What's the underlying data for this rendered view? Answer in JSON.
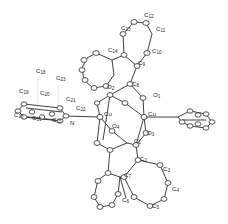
{
  "diagram": {
    "type": "ORTEP molecular structure",
    "metal_centers": [
      {
        "label": "Cu",
        "x": 100,
        "y": 117
      },
      {
        "label": "Cu",
        "x": 144,
        "y": 117
      }
    ],
    "atom_labels": [
      {
        "id": "C12",
        "base": "C",
        "sub": "12",
        "x": 144,
        "y": 17
      },
      {
        "id": "C13",
        "base": "C",
        "sub": "13",
        "x": 121,
        "y": 30
      },
      {
        "id": "C11",
        "base": "C",
        "sub": "11",
        "x": 156,
        "y": 31
      },
      {
        "id": "C14",
        "base": "C",
        "sub": "14",
        "x": 108,
        "y": 52
      },
      {
        "id": "C10",
        "base": "C",
        "sub": "10",
        "x": 152,
        "y": 53
      },
      {
        "id": "C9",
        "base": "C",
        "sub": "9",
        "x": 138,
        "y": 65
      },
      {
        "id": "C18",
        "base": "C",
        "sub": "18",
        "x": 36,
        "y": 73
      },
      {
        "id": "C23",
        "base": "C",
        "sub": "23",
        "x": 56,
        "y": 80
      },
      {
        "id": "O2",
        "base": "O",
        "sub": "2",
        "x": 107,
        "y": 89
      },
      {
        "id": "C8",
        "base": "C",
        "sub": "8",
        "x": 132,
        "y": 86
      },
      {
        "id": "C19",
        "base": "C",
        "sub": "19",
        "x": 19,
        "y": 93
      },
      {
        "id": "C20",
        "base": "C",
        "sub": "20",
        "x": 40,
        "y": 95
      },
      {
        "id": "O1",
        "base": "O",
        "sub": "1",
        "x": 153,
        "y": 97
      },
      {
        "id": "C21",
        "base": "C",
        "sub": "21",
        "x": 66,
        "y": 101
      },
      {
        "id": "C22",
        "base": "C",
        "sub": "22",
        "x": 76,
        "y": 110
      },
      {
        "id": "C17",
        "base": "C",
        "sub": "17",
        "x": 14,
        "y": 117
      },
      {
        "id": "C16",
        "base": "C",
        "sub": "16",
        "x": 32,
        "y": 120
      },
      {
        "id": "C15",
        "base": "C",
        "sub": "15",
        "x": 52,
        "y": 122
      },
      {
        "id": "N",
        "base": "N",
        "sub": "",
        "x": 70,
        "y": 125
      },
      {
        "id": "O4",
        "base": "O",
        "sub": "4",
        "x": 112,
        "y": 128
      },
      {
        "id": "O3",
        "base": "O",
        "sub": "3",
        "x": 147,
        "y": 135
      },
      {
        "id": "C1",
        "base": "C",
        "sub": "1",
        "x": 134,
        "y": 143
      },
      {
        "id": "C2",
        "base": "C",
        "sub": "2",
        "x": 140,
        "y": 161
      },
      {
        "id": "C3",
        "base": "C",
        "sub": "3",
        "x": 163,
        "y": 171
      },
      {
        "id": "C7",
        "base": "C",
        "sub": "7",
        "x": 124,
        "y": 177
      },
      {
        "id": "C4",
        "base": "C",
        "sub": "4",
        "x": 172,
        "y": 191
      },
      {
        "id": "C6",
        "base": "C",
        "sub": "6",
        "x": 122,
        "y": 202
      },
      {
        "id": "C5",
        "base": "C",
        "sub": "5",
        "x": 152,
        "y": 208
      }
    ],
    "colors": {
      "ink": "#2a2a2a",
      "background": "#ffffff"
    }
  }
}
